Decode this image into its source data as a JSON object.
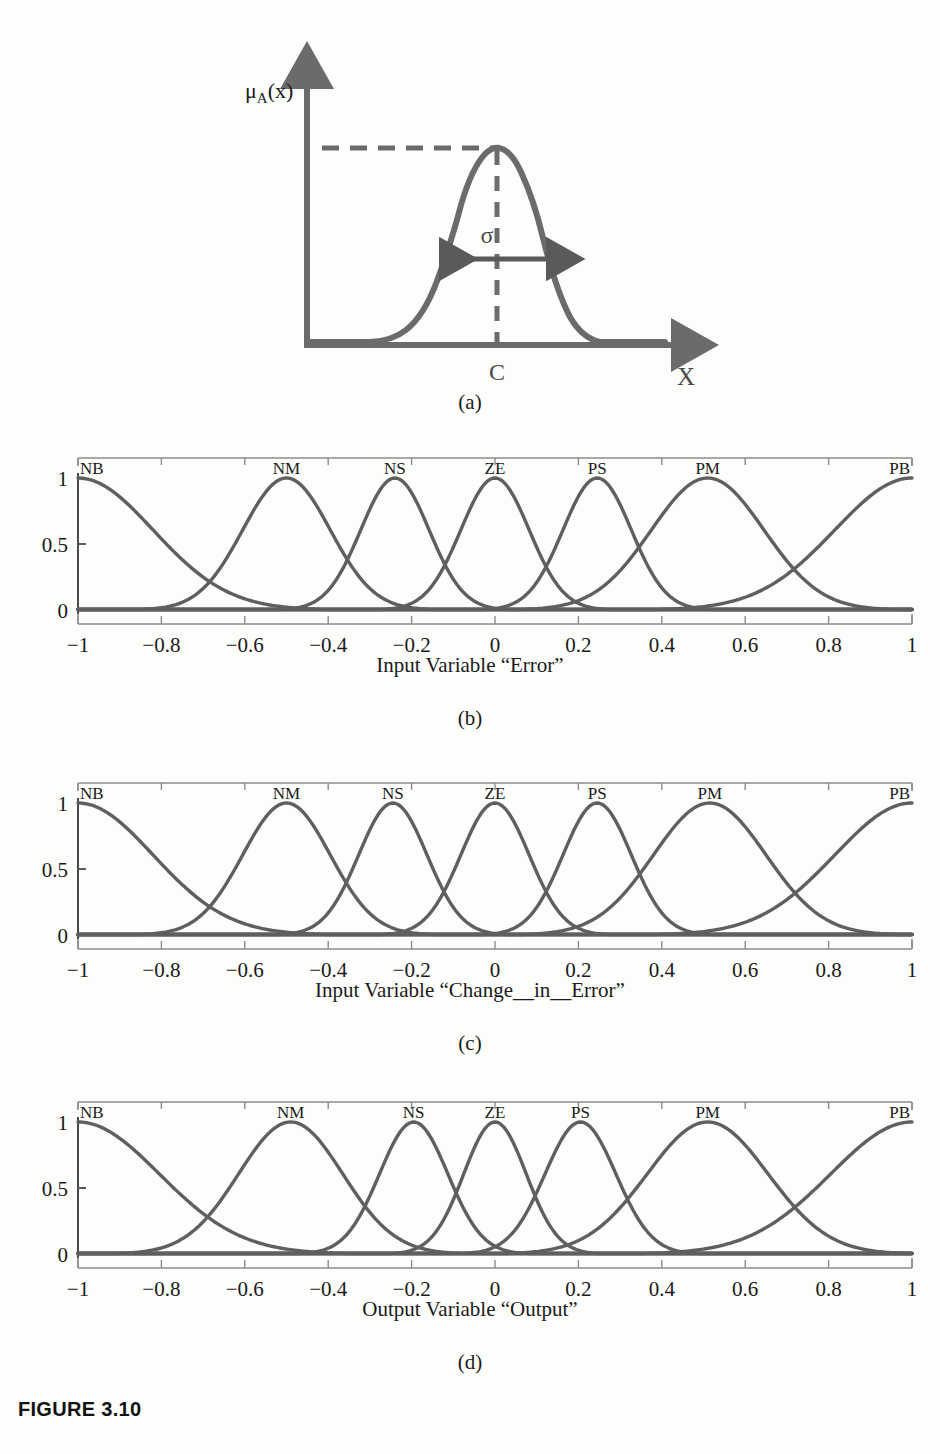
{
  "figure": {
    "caption": "FIGURE 3.10",
    "sub_captions": {
      "a": "(a)",
      "b": "(b)",
      "c": "(c)",
      "d": "(d)"
    }
  },
  "panel_a": {
    "y_axis_label": "μᴀ(x)",
    "y_axis_label_parts": {
      "mu": "μ",
      "sub": "A",
      "rest": "(x)"
    },
    "x_axis_label": "X",
    "center_label": "C",
    "sigma_label": "σ",
    "curve_color": "#6b6b6b",
    "axis_color": "#6b6b6b"
  },
  "axis": {
    "y_ticks": [
      "0",
      "0.5",
      "1"
    ],
    "y_tick_values": [
      0,
      0.5,
      1
    ],
    "x_ticks": [
      "−1",
      "−0.8",
      "−0.6",
      "−0.4",
      "−0.2",
      "0",
      "0.2",
      "0.4",
      "0.6",
      "0.8",
      "1"
    ],
    "x_tick_values": [
      -1,
      -0.8,
      -0.6,
      -0.4,
      -0.2,
      0,
      0.2,
      0.4,
      0.6,
      0.8,
      1
    ],
    "xlim": [
      -1,
      1
    ],
    "ylim": [
      0,
      1
    ],
    "line_color": "#5f5f5f",
    "frame_color": "#8c8c8c"
  },
  "chart_data": [
    {
      "id": "panel_b",
      "type": "line",
      "title": "Input Variable “Error”",
      "xlabel": "Input Variable “Error”",
      "ylabel": "",
      "xlim": [
        -1,
        1
      ],
      "ylim": [
        0,
        1
      ],
      "grid": false,
      "legend": "inline-top",
      "x_ticks": [
        -1,
        -0.8,
        -0.6,
        -0.4,
        -0.2,
        0,
        0.2,
        0.4,
        0.6,
        0.8,
        1
      ],
      "y_ticks": [
        0,
        0.5,
        1
      ],
      "series": [
        {
          "name": "NB",
          "center": -1.0,
          "sigma": 0.18,
          "label_x": -0.98,
          "peak": 1
        },
        {
          "name": "NM",
          "center": -0.5,
          "sigma": 0.105,
          "label_x": -0.5,
          "peak": 1
        },
        {
          "name": "NS",
          "center": -0.24,
          "sigma": 0.082,
          "label_x": -0.24,
          "peak": 1
        },
        {
          "name": "ZE",
          "center": 0.0,
          "sigma": 0.082,
          "label_x": 0.0,
          "peak": 1
        },
        {
          "name": "PS",
          "center": 0.245,
          "sigma": 0.082,
          "label_x": 0.245,
          "peak": 1
        },
        {
          "name": "PM",
          "center": 0.51,
          "sigma": 0.135,
          "label_x": 0.51,
          "peak": 1
        },
        {
          "name": "PB",
          "center": 1.0,
          "sigma": 0.185,
          "label_x": 0.98,
          "peak": 1
        }
      ]
    },
    {
      "id": "panel_c",
      "type": "line",
      "title": "Input Variable “Change__in__Error”",
      "xlabel": "Input Variable “Change__in__Error”",
      "ylabel": "",
      "xlim": [
        -1,
        1
      ],
      "ylim": [
        0,
        1
      ],
      "grid": false,
      "legend": "inline-top",
      "x_ticks": [
        -1,
        -0.8,
        -0.6,
        -0.4,
        -0.2,
        0,
        0.2,
        0.4,
        0.6,
        0.8,
        1
      ],
      "y_ticks": [
        0,
        0.5,
        1
      ],
      "series": [
        {
          "name": "NB",
          "center": -1.0,
          "sigma": 0.18,
          "label_x": -0.98,
          "peak": 1
        },
        {
          "name": "NM",
          "center": -0.5,
          "sigma": 0.105,
          "label_x": -0.5,
          "peak": 1
        },
        {
          "name": "NS",
          "center": -0.245,
          "sigma": 0.082,
          "label_x": -0.245,
          "peak": 1
        },
        {
          "name": "ZE",
          "center": 0.0,
          "sigma": 0.082,
          "label_x": 0.0,
          "peak": 1
        },
        {
          "name": "PS",
          "center": 0.245,
          "sigma": 0.082,
          "label_x": 0.245,
          "peak": 1
        },
        {
          "name": "PM",
          "center": 0.515,
          "sigma": 0.135,
          "label_x": 0.515,
          "peak": 1
        },
        {
          "name": "PB",
          "center": 1.0,
          "sigma": 0.185,
          "label_x": 0.98,
          "peak": 1
        }
      ]
    },
    {
      "id": "panel_d",
      "type": "line",
      "title": "Output Variable “Output”",
      "xlabel": "Output Variable “Output”",
      "ylabel": "",
      "xlim": [
        -1,
        1
      ],
      "ylim": [
        0,
        1
      ],
      "grid": false,
      "legend": "inline-top",
      "x_ticks": [
        -1,
        -0.8,
        -0.6,
        -0.4,
        -0.2,
        0,
        0.2,
        0.4,
        0.6,
        0.8,
        1
      ],
      "y_ticks": [
        0,
        0.5,
        1
      ],
      "series": [
        {
          "name": "NB",
          "center": -1.0,
          "sigma": 0.195,
          "label_x": -0.97,
          "peak": 1
        },
        {
          "name": "NM",
          "center": -0.49,
          "sigma": 0.125,
          "label_x": -0.49,
          "peak": 1
        },
        {
          "name": "NS",
          "center": -0.195,
          "sigma": 0.082,
          "label_x": -0.195,
          "peak": 1
        },
        {
          "name": "ZE",
          "center": 0.0,
          "sigma": 0.075,
          "label_x": 0.0,
          "peak": 1
        },
        {
          "name": "PS",
          "center": 0.205,
          "sigma": 0.085,
          "label_x": 0.205,
          "peak": 1
        },
        {
          "name": "PM",
          "center": 0.51,
          "sigma": 0.145,
          "label_x": 0.51,
          "peak": 1
        },
        {
          "name": "PB",
          "center": 1.0,
          "sigma": 0.195,
          "label_x": 0.97,
          "peak": 1
        }
      ]
    }
  ]
}
